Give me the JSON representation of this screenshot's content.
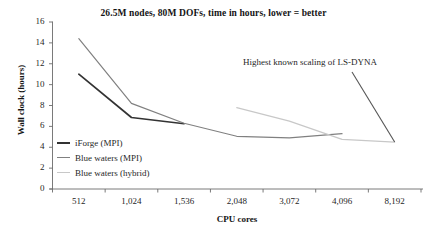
{
  "chart_data": {
    "type": "line",
    "title": "26.5M nodes, 80M DOFs, time in hours, lower = better",
    "xlabel": "CPU cores",
    "ylabel": "Wall clock (hours)",
    "categories": [
      "512",
      "1,024",
      "1,536",
      "2,048",
      "3,072",
      "4,096",
      "8,192"
    ],
    "ylim": [
      0,
      16
    ],
    "yticks": [
      "0",
      "2",
      "4",
      "6",
      "8",
      "10",
      "12",
      "14",
      "16"
    ],
    "grid": false,
    "legend_position": "inside-left",
    "series": [
      {
        "name": "iForge (MPI)",
        "color": "#333333",
        "x": [
          "512",
          "1,024",
          "1,536"
        ],
        "values": [
          11.0,
          6.85,
          6.25
        ]
      },
      {
        "name": "Blue waters (MPI)",
        "color": "#808080",
        "x": [
          "512",
          "1,024",
          "1,536",
          "2,048",
          "3,072",
          "4,096"
        ],
        "values": [
          14.4,
          8.2,
          6.3,
          5.05,
          4.9,
          5.3
        ]
      },
      {
        "name": "Blue waters (hybrid)",
        "color": "#c8c8c8",
        "x": [
          "2,048",
          "3,072",
          "4,096",
          "8,192"
        ],
        "values": [
          7.8,
          6.5,
          4.75,
          4.5
        ]
      }
    ],
    "annotations": [
      {
        "text": "Highest known scaling of LS-DYNA",
        "points_to_category": "8,192",
        "points_to_value": 4.5
      }
    ]
  }
}
